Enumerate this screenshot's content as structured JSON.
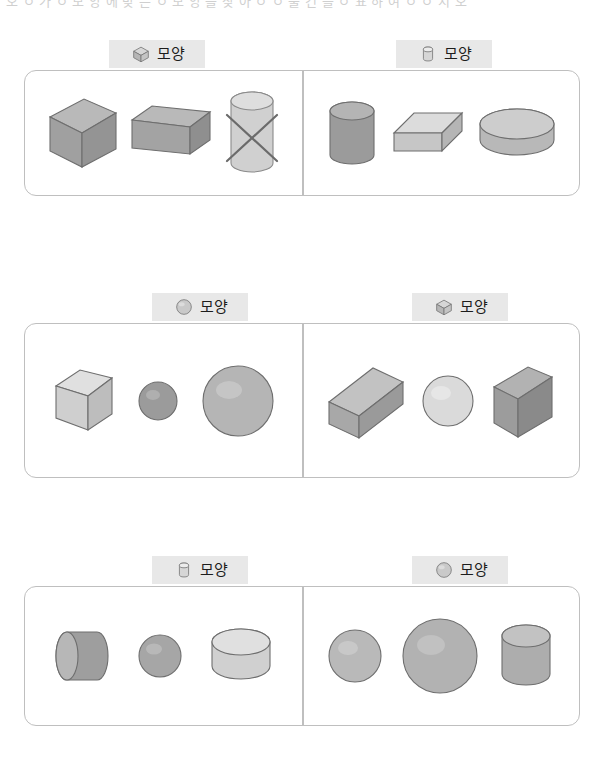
{
  "header": {
    "faint_text": "오 ㅇ 가 ㅇ 모 양 에 맞 는 ㅇ 모 양 을 찾 아 ㅇ ㅇ 물 건 을 ㅇ 표 하 여 ㅇ ㅇ 시 오"
  },
  "shape_label": "모양",
  "colors": {
    "tag_background": "#e8e8e8",
    "panel_border": "#bfbfbf",
    "shape_mid_gray": "#9a9a9a",
    "shape_light_gray": "#cfcfcf",
    "shape_dark_gray": "#8a8a8a",
    "outline": "#6e6e6e",
    "cross_mark": "#6b6b6b",
    "page_background": "#ffffff"
  },
  "rows": [
    {
      "id": "row-1",
      "left": {
        "tag_icon": "cube-icon",
        "tag_label": "모양",
        "items": [
          {
            "name": "cube",
            "tone": "mid",
            "marked": false
          },
          {
            "name": "rectangular-prism-flat",
            "tone": "mid",
            "marked": false
          },
          {
            "name": "cylinder-upright",
            "tone": "light",
            "marked": true
          }
        ]
      },
      "right": {
        "tag_icon": "cylinder-icon",
        "tag_label": "모양",
        "items": [
          {
            "name": "cylinder-upright",
            "tone": "dark",
            "marked": false
          },
          {
            "name": "rectangular-prism-flat",
            "tone": "light",
            "marked": false
          },
          {
            "name": "cylinder-wide-disc",
            "tone": "light",
            "marked": false
          }
        ]
      }
    },
    {
      "id": "row-2",
      "left": {
        "tag_icon": "sphere-icon",
        "tag_label": "모양",
        "items": [
          {
            "name": "cube",
            "tone": "light",
            "marked": false
          },
          {
            "name": "sphere-small",
            "tone": "dark",
            "marked": false
          },
          {
            "name": "sphere-large",
            "tone": "mid",
            "marked": false
          }
        ]
      },
      "right": {
        "tag_icon": "cube-icon",
        "tag_label": "모양",
        "items": [
          {
            "name": "rectangular-prism-long",
            "tone": "mid",
            "marked": false
          },
          {
            "name": "sphere-medium",
            "tone": "light",
            "marked": false
          },
          {
            "name": "rectangular-prism-tall",
            "tone": "dark",
            "marked": false
          }
        ]
      }
    },
    {
      "id": "row-3",
      "left": {
        "tag_icon": "cylinder-icon",
        "tag_label": "모양",
        "items": [
          {
            "name": "cylinder-lying",
            "tone": "dark",
            "marked": false
          },
          {
            "name": "sphere-small",
            "tone": "dark",
            "marked": false
          },
          {
            "name": "cylinder-wide-short",
            "tone": "light",
            "marked": false
          }
        ]
      },
      "right": {
        "tag_icon": "sphere-icon",
        "tag_label": "모양",
        "items": [
          {
            "name": "sphere-small",
            "tone": "mid",
            "marked": false
          },
          {
            "name": "sphere-large",
            "tone": "mid",
            "marked": false
          },
          {
            "name": "cylinder-upright",
            "tone": "mid",
            "marked": false
          }
        ]
      }
    }
  ]
}
